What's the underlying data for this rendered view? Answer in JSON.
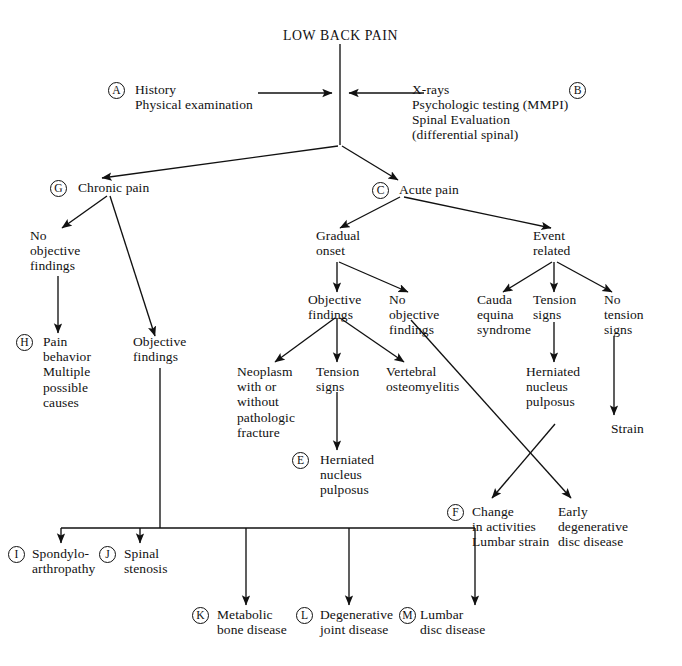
{
  "figure": {
    "title": "LOW BACK PAIN",
    "kind": "clinical-decision-algorithm"
  },
  "nodes": {
    "root": "LOW BACK PAIN",
    "a_line1": "History",
    "a_line2": "Physical examination",
    "b_line1": "X-rays",
    "b_line2": "Psychologic testing (MMPI)",
    "b_line3": "Spinal Evaluation",
    "b_line4": "(differential spinal)",
    "chronic_pain": "Chronic pain",
    "acute_pain": "Acute pain",
    "no_objective_findings_chronic": "No\nobjective\nfindings",
    "objective_findings_chronic": "Objective\nfindings",
    "pain_behavior": "Pain\nbehavior\nMultiple\npossible\ncauses",
    "gradual_onset": "Gradual\nonset",
    "event_related": "Event\nrelated",
    "objective_findings_gradual": "Objective\nfindings",
    "no_objective_findings_gradual": "No\nobjective\nfindings",
    "neoplasm": "Neoplasm\nwith or\nwithout\npathologic\nfracture",
    "tension_signs_gradual": "Tension\nsigns",
    "vertebral_osteomyelitis": "Vertebral\nosteomyelitis",
    "herniated_nucleus_pulposus_e": "Herniated\nnucleus\npulposus",
    "cauda_equina": "Cauda\nequina\nsyndrome",
    "tension_signs_event": "Tension\nsigns",
    "no_tension_signs": "No\ntension\nsigns",
    "herniated_nucleus_pulposus_event": "Herniated\nnucleus\npulposus",
    "strain": "Strain",
    "change_in_activities": "Change\nin activities\nLumbar strain",
    "early_degenerative": "Early\ndegenerative\ndisc disease",
    "spondyloarthropathy": "Spondylo-\narthropathy",
    "spinal_stenosis": "Spinal\nstenosis",
    "metabolic_bone_disease": "Metabolic\nbone disease",
    "degenerative_joint_disease": "Degenerative\njoint disease",
    "lumbar_disc_disease": "Lumbar\ndisc disease"
  },
  "keys": {
    "a": "A",
    "b": "B",
    "c": "C",
    "e": "E",
    "f": "F",
    "g": "G",
    "h": "H",
    "i": "I",
    "j": "J",
    "k": "K",
    "l": "L",
    "m": "M"
  },
  "style": {
    "line_color": "#111111",
    "text_color": "#111111",
    "background": "#ffffff"
  }
}
